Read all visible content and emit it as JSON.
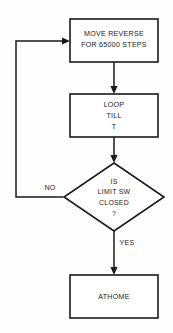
{
  "diagram": {
    "orientation": "top-to-bottom",
    "background_color": "#fefefe",
    "line_color": "#1a1a1a",
    "nodes": [
      {
        "id": "move-reverse",
        "type": "process",
        "lines": [
          "MOVE REVERSE",
          "FOR 65000 STEPS"
        ]
      },
      {
        "id": "loop-till-t",
        "type": "process",
        "lines": [
          "LOOP",
          "TILL",
          "T"
        ]
      },
      {
        "id": "limit-sw-decision",
        "type": "decision",
        "lines": [
          "IS",
          "LIMIT SW",
          "CLOSED",
          "?"
        ]
      },
      {
        "id": "athome",
        "type": "process",
        "lines": [
          "ATHOME"
        ]
      }
    ],
    "edges": [
      {
        "id": "move-to-loop",
        "from": "move-reverse",
        "to": "loop-till-t",
        "label": ""
      },
      {
        "id": "loop-to-decision",
        "from": "loop-till-t",
        "to": "limit-sw-decision",
        "label": ""
      },
      {
        "id": "decision-no-feedback",
        "from": "limit-sw-decision",
        "to": "move-reverse",
        "label": "NO"
      },
      {
        "id": "decision-yes-athome",
        "from": "limit-sw-decision",
        "to": "athome",
        "label": "YES"
      }
    ]
  }
}
